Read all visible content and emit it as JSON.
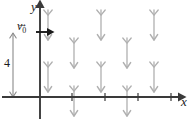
{
  "figure": {
    "background_color": "#ffffff",
    "axis_color": "#3a3a3a",
    "arrow_color": "#b0b0b0",
    "label_color": "#1a1a1a"
  },
  "labels": {
    "y_axis": "y",
    "x_axis": "x",
    "initial_velocity": "v",
    "initial_velocity_subscript": "0",
    "initial_velocity_full": "v⃗0",
    "height_value": "4"
  },
  "axes": {
    "origin": {
      "x": 40,
      "y": 97
    },
    "x_axis": {
      "start_x": 2,
      "end_x": 178,
      "y": 97,
      "has_arrowhead": true,
      "arrow_direction": "right",
      "tick_positions": [
        72,
        105,
        138,
        171
      ],
      "tick_half_height": 4
    },
    "y_axis": {
      "x": 40,
      "start_y": 119,
      "end_y": 8,
      "has_arrowhead": true,
      "arrow_direction": "up"
    }
  },
  "initial_velocity_vector": {
    "start_x": 36,
    "end_x": 52,
    "y": 32,
    "direction": "right",
    "color": "#1a1a1a"
  },
  "height_measure": {
    "x": 13,
    "top_y": 33,
    "bottom_y": 97,
    "double_headed": true,
    "label": "4",
    "color": "#8a8a8a"
  },
  "chart_data": {
    "type": "scatter",
    "xlabel": "x",
    "ylabel": "y",
    "field_description": "uniform downward-pointing arrows arranged in a staggered grid",
    "arrow_style": {
      "head": "v-shaped arrowhead at bottom",
      "tail": "v-shaped fletching at top",
      "length": 30,
      "color": "#b0b0b0"
    },
    "arrows": [
      {
        "x": 48,
        "y": 10,
        "length": 30,
        "direction": "down"
      },
      {
        "x": 101,
        "y": 10,
        "length": 30,
        "direction": "down"
      },
      {
        "x": 154,
        "y": 10,
        "length": 30,
        "direction": "down"
      },
      {
        "x": 74,
        "y": 38,
        "length": 30,
        "direction": "down"
      },
      {
        "x": 127,
        "y": 38,
        "length": 30,
        "direction": "down"
      },
      {
        "x": 48,
        "y": 62,
        "length": 30,
        "direction": "down"
      },
      {
        "x": 101,
        "y": 62,
        "length": 30,
        "direction": "down"
      },
      {
        "x": 154,
        "y": 62,
        "length": 30,
        "direction": "down"
      },
      {
        "x": 74,
        "y": 86,
        "length": 30,
        "direction": "down"
      },
      {
        "x": 127,
        "y": 86,
        "length": 30,
        "direction": "down"
      }
    ]
  }
}
